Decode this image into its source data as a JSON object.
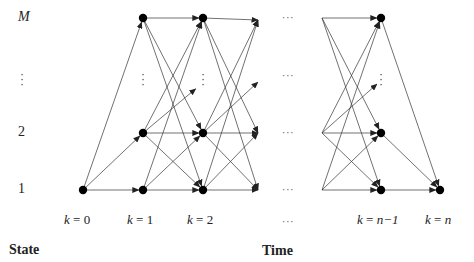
{
  "diagram": {
    "type": "trellis",
    "state_axis_title": "State",
    "time_axis_title": "Time",
    "state_labels": [
      {
        "id": "M",
        "text": "M",
        "italic": true,
        "y": 18
      },
      {
        "id": "dots",
        "text": "⋮",
        "y": 80
      },
      {
        "id": "2",
        "text": "2",
        "y": 133
      },
      {
        "id": "1",
        "text": "1",
        "y": 190
      }
    ],
    "time_labels": [
      {
        "var": "k",
        "eq": " = ",
        "val": "0",
        "x": 83
      },
      {
        "var": "k",
        "eq": " = ",
        "val": "1",
        "x": 143
      },
      {
        "var": "k",
        "eq": " = ",
        "val": "2",
        "x": 203
      },
      {
        "var": "",
        "eq": "",
        "val": "···",
        "x": 290
      },
      {
        "var": "k",
        "eq": " = ",
        "val": "n−1",
        "x": 381
      },
      {
        "var": "k",
        "eq": " = ",
        "val": "n",
        "x": 440
      }
    ],
    "ellipsis_horizontal": "···",
    "ellipsis_vertical": "⋮",
    "colors": {
      "node": "#000000",
      "edge": "#333333",
      "text": "#222222"
    }
  }
}
